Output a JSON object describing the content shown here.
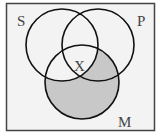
{
  "diagram": {
    "type": "venn-3",
    "sets": [
      {
        "id": "S",
        "label": "S"
      },
      {
        "id": "P",
        "label": "P"
      },
      {
        "id": "M",
        "label": "M"
      }
    ],
    "shaded_region": "M minus S",
    "marker": {
      "label": "X",
      "region": "S∩P∩M"
    },
    "colors": {
      "background": "#f3f3f3",
      "frame": "#444444",
      "circle_stroke": "#111111",
      "shade": "#c8c8c8"
    }
  }
}
